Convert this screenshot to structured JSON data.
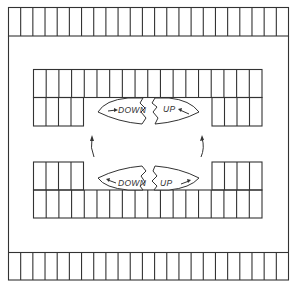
{
  "diagram": {
    "title": "",
    "type": "parking garage floor plan",
    "colors": {
      "line": "#333333",
      "background": "#ffffff"
    },
    "outer_rows": {
      "top": {
        "stalls": 23,
        "x": 8,
        "y": 7,
        "width": 281,
        "height": 29
      },
      "bottom": {
        "stalls": 23,
        "x": 8,
        "y": 252,
        "width": 281,
        "height": 28
      }
    },
    "inner_blocks": [
      {
        "name": "top-left",
        "top_stalls": 9,
        "bottom_stalls": 4
      },
      {
        "name": "top-right",
        "top_stalls": 9,
        "bottom_stalls": 4
      },
      {
        "name": "bottom-left",
        "top_stalls": 4,
        "bottom_stalls": 9
      },
      {
        "name": "bottom-right",
        "top_stalls": 4,
        "bottom_stalls": 9
      }
    ],
    "ramps": [
      {
        "position": "top-left",
        "label": "DOWN",
        "arrow": "right"
      },
      {
        "position": "top-right",
        "label": "UP",
        "arrow": "left"
      },
      {
        "position": "bottom-left",
        "label": "DOWN",
        "arrow": "left"
      },
      {
        "position": "bottom-right",
        "label": "UP",
        "arrow": "right"
      }
    ],
    "flow_arrows": [
      {
        "position": "left",
        "direction": "up"
      },
      {
        "position": "right",
        "direction": "up"
      }
    ]
  }
}
